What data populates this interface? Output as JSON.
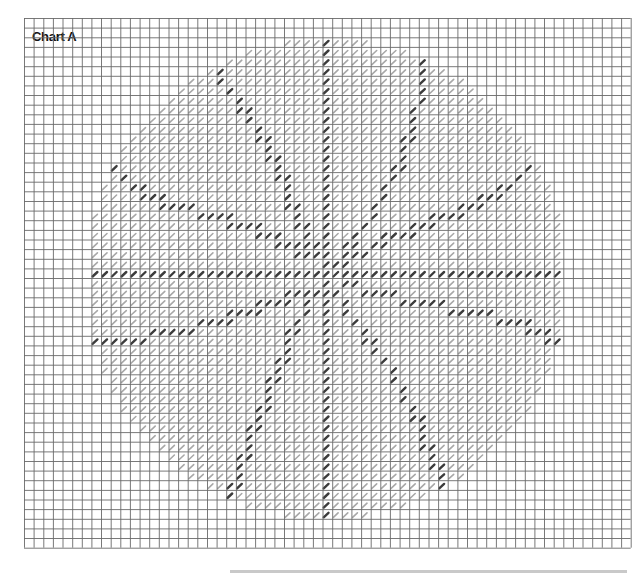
{
  "title": "Chart A",
  "grid": {
    "cols": 63,
    "rows": 55,
    "cell_size": 9.63,
    "line_color": "#6a6a6a",
    "background": "#ffffff"
  },
  "motif": {
    "shape": "circle",
    "center_col": 31,
    "center_row": 26.5,
    "radius_cells": 25,
    "symbol": "slash",
    "light_color": "#a8a8a8",
    "dark_color": "#3c3c3c",
    "dark_lines": [
      {
        "name": "horizontal-bar",
        "points": [
          [
            6,
            26
          ],
          [
            56,
            26
          ]
        ]
      },
      {
        "name": "vertical-bar",
        "points": [
          [
            31,
            2
          ],
          [
            31,
            51
          ]
        ]
      },
      {
        "name": "arm-top-left",
        "points": [
          [
            19,
            4
          ],
          [
            21,
            7
          ],
          [
            24,
            11
          ],
          [
            26,
            15
          ],
          [
            28,
            20
          ],
          [
            30,
            24
          ]
        ]
      },
      {
        "name": "arm-left-upper",
        "points": [
          [
            8,
            14
          ],
          [
            11,
            17
          ],
          [
            15,
            19
          ],
          [
            20,
            20
          ],
          [
            25,
            22
          ],
          [
            29,
            24
          ]
        ]
      },
      {
        "name": "arm-top-right",
        "points": [
          [
            41,
            2
          ],
          [
            41,
            6
          ],
          [
            40,
            11
          ],
          [
            38,
            16
          ],
          [
            35,
            21
          ],
          [
            32,
            25
          ]
        ]
      },
      {
        "name": "arm-right-upper",
        "points": [
          [
            53,
            14
          ],
          [
            50,
            17
          ],
          [
            46,
            19
          ],
          [
            41,
            21
          ],
          [
            36,
            23
          ],
          [
            33,
            25
          ]
        ]
      },
      {
        "name": "arm-right-lower",
        "points": [
          [
            55,
            33
          ],
          [
            51,
            31
          ],
          [
            46,
            30
          ],
          [
            41,
            29
          ],
          [
            36,
            28
          ],
          [
            33,
            27
          ]
        ]
      },
      {
        "name": "arm-bottom-right",
        "points": [
          [
            44,
            49
          ],
          [
            42,
            45
          ],
          [
            40,
            40
          ],
          [
            37,
            35
          ],
          [
            34,
            31
          ],
          [
            32,
            28
          ]
        ]
      },
      {
        "name": "arm-bottom-left",
        "points": [
          [
            21,
            50
          ],
          [
            22,
            46
          ],
          [
            24,
            41
          ],
          [
            26,
            36
          ],
          [
            28,
            31
          ],
          [
            30,
            28
          ]
        ]
      },
      {
        "name": "arm-left-lower",
        "points": [
          [
            7,
            33
          ],
          [
            10,
            33
          ],
          [
            15,
            32
          ],
          [
            20,
            31
          ],
          [
            25,
            29
          ],
          [
            29,
            28
          ]
        ]
      }
    ]
  },
  "footer_bar": {
    "visible": true
  }
}
